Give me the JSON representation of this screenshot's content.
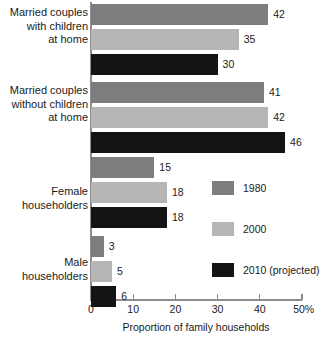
{
  "chart_data": {
    "type": "bar",
    "orientation": "horizontal",
    "title": "",
    "subtitle": "",
    "xlabel": "Proportion of family households",
    "ylabel": "",
    "xlim": [
      0,
      50
    ],
    "xticks": [
      0,
      10,
      20,
      30,
      40,
      50
    ],
    "xticklabels": [
      "0",
      "10",
      "20",
      "30",
      "40",
      "50%"
    ],
    "grid": false,
    "legend_position": "right",
    "categories": [
      "Married couples\nwith children\nat home",
      "Married couples\nwithout children\nat home",
      "Female\nhouseholders",
      "Male\nhouseholders"
    ],
    "series": [
      {
        "name": "1980",
        "color": "#7d7d7d",
        "values": [
          42,
          41,
          15,
          3
        ]
      },
      {
        "name": "2000",
        "color": "#b6b6b6",
        "values": [
          35,
          42,
          18,
          5
        ]
      },
      {
        "name": "2010 (projected)",
        "color": "#141414",
        "values": [
          30,
          46,
          18,
          6
        ]
      }
    ],
    "value_labels": [
      "42",
      "35",
      "30",
      "41",
      "42",
      "46",
      "15",
      "18",
      "18",
      "3",
      "5",
      "6"
    ]
  },
  "axis": {
    "ticks": [
      {
        "label": "0",
        "value": 0
      },
      {
        "label": "10",
        "value": 10
      },
      {
        "label": "20",
        "value": 20
      },
      {
        "label": "30",
        "value": 30
      },
      {
        "label": "40",
        "value": 40
      },
      {
        "label": "50%",
        "value": 50
      }
    ],
    "x_title": "Proportion of family households"
  },
  "categories": [
    {
      "label": "Married couples\nwith children\nat home"
    },
    {
      "label": "Married couples\nwithout children\nat home"
    },
    {
      "label": "Female\nhouseholders"
    },
    {
      "label": "Male\nhouseholders"
    }
  ],
  "legend": {
    "items": [
      {
        "label": "1980",
        "color": "#7d7d7d"
      },
      {
        "label": "2000",
        "color": "#b6b6b6"
      },
      {
        "label": "2010 (projected)",
        "color": "#141414"
      }
    ]
  },
  "bars": [
    {
      "value": 42,
      "label": "42",
      "series": 0,
      "group": 0
    },
    {
      "value": 35,
      "label": "35",
      "series": 1,
      "group": 0
    },
    {
      "value": 30,
      "label": "30",
      "series": 2,
      "group": 0
    },
    {
      "value": 41,
      "label": "41",
      "series": 0,
      "group": 1
    },
    {
      "value": 42,
      "label": "42",
      "series": 1,
      "group": 1
    },
    {
      "value": 46,
      "label": "46",
      "series": 2,
      "group": 1
    },
    {
      "value": 15,
      "label": "15",
      "series": 0,
      "group": 2
    },
    {
      "value": 18,
      "label": "18",
      "series": 1,
      "group": 2
    },
    {
      "value": 18,
      "label": "18",
      "series": 2,
      "group": 2
    },
    {
      "value": 3,
      "label": "3",
      "series": 0,
      "group": 3
    },
    {
      "value": 5,
      "label": "5",
      "series": 1,
      "group": 3
    },
    {
      "value": 6,
      "label": "6",
      "series": 2,
      "group": 3
    }
  ]
}
